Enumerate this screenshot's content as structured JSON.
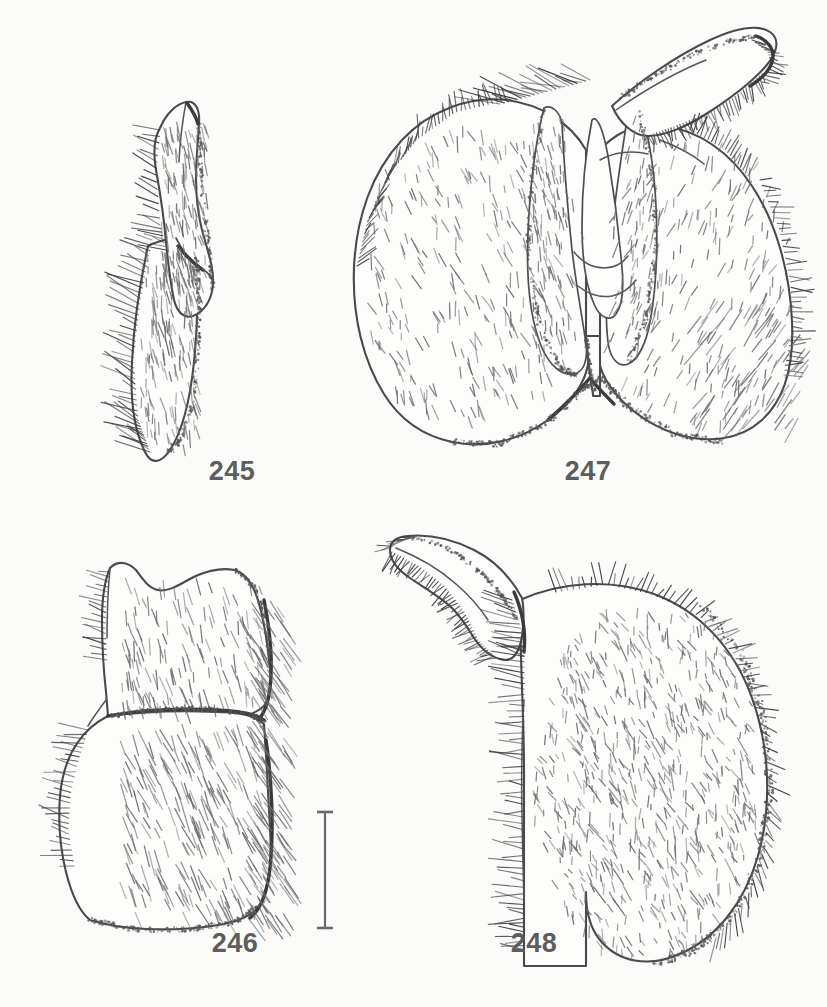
{
  "plate": {
    "kind": "scientific-illustration-plate",
    "subject": "insect male genitalia line drawings",
    "background_color": "#fbfbfa",
    "ink_color": "#4a4a4a",
    "label_color": "#5d5d5d",
    "width": 827,
    "height": 1007
  },
  "figures": [
    {
      "id": "245",
      "label": "245",
      "label_x": 232,
      "label_y": 470,
      "description": "narrow elongate curved sclerite, upper hook-like lobe over a lower tapering blade, dense oblique hatching on left margin",
      "position": "upper-left"
    },
    {
      "id": "247",
      "label": "247",
      "label_x": 588,
      "label_y": 470,
      "description": "bilaterally symmetric genital capsule, two broad rounded lateral lobes with central V notch, paired inner blades, dorsal arm projecting to upper right ending in dark fringed hook",
      "position": "upper-right"
    },
    {
      "id": "246",
      "label": "246",
      "label_x": 235,
      "label_y": 942,
      "description": "two-segment plate, upper segment with crenulate dorsal margin, transverse division, lower segment with lateral notch and dense oblique hatching",
      "position": "lower-left"
    },
    {
      "id": "248",
      "label": "248",
      "label_x": 534,
      "label_y": 942,
      "description": "single broad rounded setose lobe densely covered with short setae, slender hooked arm extending to upper left with comb of marginal setae",
      "position": "lower-right"
    }
  ],
  "scale_bar": {
    "name": "scale-bar",
    "orientation": "vertical",
    "x": 325,
    "y_top": 812,
    "y_bottom": 928,
    "label": "",
    "has_end_caps": true,
    "cap_width": 16,
    "color": "#6a6a6a"
  }
}
